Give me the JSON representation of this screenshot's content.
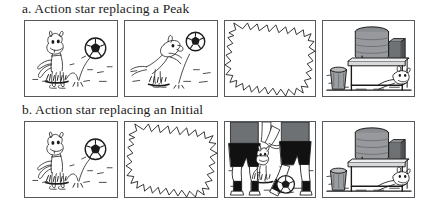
{
  "figure": {
    "background_color": "#ffffff",
    "panel_border_color": "#55585c",
    "ink_color": "#1b1b1b",
    "rows": [
      {
        "id": "row-a",
        "caption": "a. Action star replacing a Peak",
        "panels": [
          {
            "index": 1,
            "name": "dog-bouncing-ball",
            "description": "Cartoon dog standing on grass watching a soccer ball bounce toward it"
          },
          {
            "index": 2,
            "name": "dog-heading-ball",
            "description": "Cartoon dog leaping up to head the soccer ball"
          },
          {
            "index": 3,
            "name": "action-star-burst",
            "description": "Jagged white action star burst filling the panel"
          },
          {
            "index": 4,
            "name": "water-cooler-table",
            "description": "Water cooler on a table beside a trash can with the dog lying underneath"
          }
        ]
      },
      {
        "id": "row-b",
        "caption": "b. Action star replacing an Initial",
        "panels": [
          {
            "index": 1,
            "name": "dog-bouncing-ball",
            "description": "Cartoon dog standing on grass watching a soccer ball bounce toward it"
          },
          {
            "index": 2,
            "name": "action-star-burst",
            "description": "Jagged white action star burst filling the panel"
          },
          {
            "index": 3,
            "name": "soccer-players-legs",
            "description": "Legs of soccer players with the dog and the ball between them"
          },
          {
            "index": 4,
            "name": "water-cooler-table",
            "description": "Water cooler on a table beside a trash can with the dog lying underneath"
          }
        ]
      }
    ]
  }
}
